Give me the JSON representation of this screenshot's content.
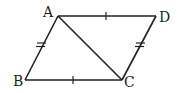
{
  "diagram": {
    "type": "parallelogram",
    "vertices": {
      "A": {
        "label": "A",
        "x": 58,
        "y": 16
      },
      "B": {
        "label": "B",
        "x": 25,
        "y": 80
      },
      "C": {
        "label": "C",
        "x": 122,
        "y": 80
      },
      "D": {
        "label": "D",
        "x": 156,
        "y": 16
      }
    },
    "edges": [
      {
        "from": "A",
        "to": "D",
        "marks": 1
      },
      {
        "from": "B",
        "to": "C",
        "marks": 1
      },
      {
        "from": "A",
        "to": "B",
        "marks": 2
      },
      {
        "from": "D",
        "to": "C",
        "marks": 2
      },
      {
        "from": "A",
        "to": "C",
        "marks": 0
      }
    ],
    "stroke_color": "#222222"
  }
}
